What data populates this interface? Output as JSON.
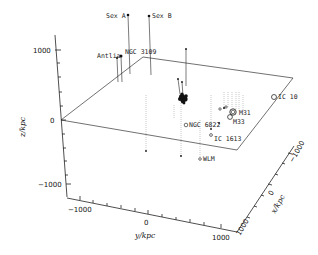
{
  "figure": {
    "type": "3d-scatter",
    "axes": {
      "z": {
        "label": "z/kpc",
        "ticks": [
          "1000",
          "0",
          "−1000"
        ]
      },
      "y": {
        "label": "y/kpc",
        "ticks": [
          "−1000",
          "0",
          "1000"
        ]
      },
      "x": {
        "label": "x/kpc",
        "ticks": [
          "1000",
          "0",
          "−1000"
        ]
      }
    },
    "galaxies": [
      {
        "name": "Sex A",
        "x": 87,
        "y": 19,
        "marker": "dot",
        "above": true
      },
      {
        "name": "Sex B",
        "x": 146,
        "y": 17,
        "marker": "dot",
        "above": true
      },
      {
        "name": "NGC 3109",
        "x": 120,
        "y": 55,
        "marker": "dot",
        "above": true
      },
      {
        "name": "Antlia",
        "x": 117,
        "y": 57,
        "marker": "dot",
        "above": true
      },
      {
        "name": "IC 10",
        "x": 273,
        "y": 97,
        "marker": "circle"
      },
      {
        "name": "M31",
        "x": 233,
        "y": 113,
        "marker": "circle-large"
      },
      {
        "name": "M33",
        "x": 230,
        "y": 118,
        "marker": "circle"
      },
      {
        "name": "NGC 6822",
        "x": 186,
        "y": 124,
        "marker": "circle"
      },
      {
        "name": "IC 1613",
        "x": 210,
        "y": 135,
        "marker": "circle-small"
      },
      {
        "name": "WLM",
        "x": 200,
        "y": 159,
        "marker": "circle-small"
      }
    ]
  }
}
